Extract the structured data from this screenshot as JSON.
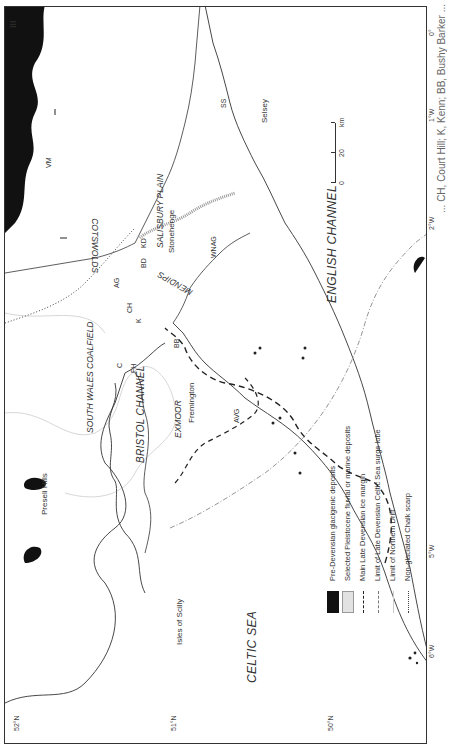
{
  "map": {
    "latitude_ticks": [
      "52°N",
      "51°N",
      "50°N"
    ],
    "longitude_ticks": [
      "6°W",
      "5°W",
      "4°W",
      "3°W",
      "2°W",
      "1°W",
      "0°"
    ],
    "corner_mark": "III",
    "sea_labels": {
      "celtic_sea": "CELTIC SEA",
      "bristol_channel": "BRISTOL CHANNEL",
      "english_channel": "ENGLISH CHANNEL"
    },
    "region_labels": {
      "south_wales_coalfield": "SOUTH WALES COALFIELD",
      "exmoor": "EXMOOR",
      "mendips": "MENDIPS",
      "cotswolds": "COTSWOLDS",
      "salisbury_plain": "SALISBURY PLAIN"
    },
    "place_labels": {
      "preseli_hills": "Preseli Hills",
      "fremington": "Fremington",
      "isles_of_scilly": "Isles of Scilly",
      "stonehenge": "Stonehenge",
      "selsey": "Selsey"
    },
    "site_codes": [
      "C",
      "FH",
      "AG",
      "CH",
      "K",
      "BB",
      "BD",
      "KD",
      "VM",
      "WNAG",
      "AVG",
      "SS"
    ]
  },
  "scale_bar": {
    "unit": "km",
    "ticks": [
      "0",
      "20"
    ]
  },
  "legend": {
    "items": [
      {
        "symbol": "solid-black-fill",
        "label": "Pre-Devensian glacigenic deposits"
      },
      {
        "symbol": "stippled-fill",
        "label": "Selected Pleistocene fluvial or marine deposits"
      },
      {
        "symbol": "bold-dashed-line",
        "label": "Main Late Devensian ice margin"
      },
      {
        "symbol": "dash-dot-line",
        "label": "Limit of Late Devensian Celtic Sea surge lobe"
      },
      {
        "symbol": "faint-solid-line",
        "label": "Limit of Northern Drift"
      },
      {
        "symbol": "dotted-line",
        "label": "Non-glaciated Chalk scarp"
      }
    ]
  },
  "caption": {
    "fragment": "... CH, Court Hill; K, Kenn; BB, Bushy Barker ..."
  }
}
